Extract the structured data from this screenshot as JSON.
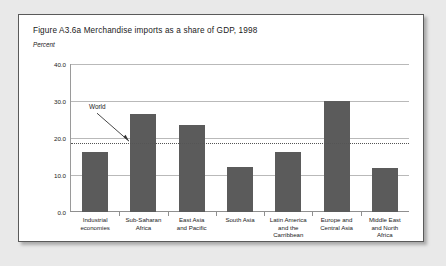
{
  "figure": {
    "title": "Figure A3.6a  Merchandise imports as a share of GDP, 1998",
    "unit_label": "Percent"
  },
  "chart_data": {
    "type": "bar",
    "title": "Figure A3.6a  Merchandise imports as a share of GDP, 1998",
    "xlabel": "",
    "ylabel": "Percent",
    "ylim": [
      0,
      40
    ],
    "yticks": [
      0.0,
      10.0,
      20.0,
      30.0,
      40.0
    ],
    "ytick_labels": [
      "0.0",
      "10.0",
      "20.0",
      "30.0",
      "40.0"
    ],
    "grid": true,
    "legend": "none",
    "bar_color": "#5b5b5b",
    "categories": [
      "Industrial economies",
      "Sub-Saharan Africa",
      "East Asia and Pacific",
      "South Asia",
      "Latin America and the Carribbean",
      "Europe and Central Asia",
      "Middle East and North Africa"
    ],
    "category_label_lines": [
      [
        "Industrial",
        "economies"
      ],
      [
        "Sub-Saharan",
        "Africa"
      ],
      [
        "East Asia",
        "and Pacific"
      ],
      [
        "South Asia"
      ],
      [
        "Latin America",
        "and the",
        "Carribbean"
      ],
      [
        "Europe and",
        "Central Asia"
      ],
      [
        "Middle East",
        "and North",
        "Africa"
      ]
    ],
    "values": [
      16.2,
      26.6,
      23.6,
      12.1,
      16.2,
      30.0,
      11.9
    ],
    "annotations": [
      {
        "label": "World",
        "value": 18.6,
        "style": "dotted-horizontal-line-with-arrow"
      }
    ]
  }
}
